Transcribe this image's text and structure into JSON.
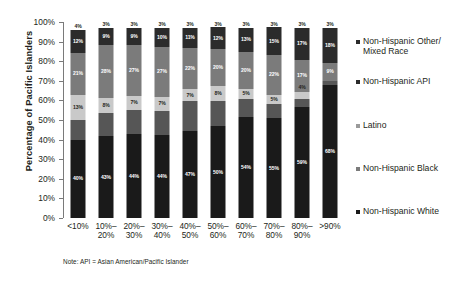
{
  "chart_data": {
    "type": "bar",
    "stacked": true,
    "stack_mode": "percent",
    "title": "",
    "xlabel": "",
    "ylabel": "Percentage of Pacific Islanders",
    "ylim": [
      0,
      100
    ],
    "ytick_labels": [
      "0%",
      "10%",
      "20%",
      "30%",
      "40%",
      "50%",
      "60%",
      "70%",
      "80%",
      "90%",
      "100%"
    ],
    "ytick_values": [
      0,
      10,
      20,
      30,
      40,
      50,
      60,
      70,
      80,
      90,
      100
    ],
    "grid": false,
    "legend_position": "right",
    "categories": [
      "<10%",
      "10%-\n20%",
      "20%-\n30%",
      "30%-\n40%",
      "40%-\n50%",
      "50%-\n60%",
      "60%-\n70%",
      "70%-\n80%",
      "80%-\n90%",
      ">90%"
    ],
    "category_labels": [
      {
        "line1": "<10%",
        "line2": ""
      },
      {
        "line1": "10%–",
        "line2": "20%"
      },
      {
        "line1": "20%–",
        "line2": "30%"
      },
      {
        "line1": "30%–",
        "line2": "40%"
      },
      {
        "line1": "40%–",
        "line2": "50%"
      },
      {
        "line1": "50%–",
        "line2": "60%"
      },
      {
        "line1": "60%–",
        "line2": "70%"
      },
      {
        "line1": "70%–",
        "line2": "80%"
      },
      {
        "line1": "80%–",
        "line2": "90%"
      },
      {
        "line1": ">90%",
        "line2": ""
      }
    ],
    "series": [
      {
        "name": "Non-Hispanic White",
        "color": "#1a1a1a",
        "values": [
          40,
          43,
          44,
          44,
          47,
          50,
          54,
          55,
          59,
          68
        ],
        "labels": [
          "40%",
          "43%",
          "44%",
          "44%",
          "47%",
          "50%",
          "54%",
          "55%",
          "59%",
          "68%"
        ]
      },
      {
        "name": "Non-Hispanic Black",
        "color": "#565656",
        "values": [
          10,
          12,
          13,
          13,
          16,
          14,
          10,
          8,
          4,
          2
        ],
        "labels": [
          "",
          "",
          "",
          "",
          "",
          "",
          "",
          "",
          "",
          ""
        ]
      },
      {
        "name": "Latino",
        "color": "#c9c9c9",
        "values": [
          13,
          8,
          7,
          7,
          7,
          8,
          5,
          5,
          4,
          0
        ],
        "labels": [
          "13%",
          "8%",
          "7%",
          "7%",
          "7%",
          "8%",
          "5%",
          "5%",
          "4%",
          ""
        ]
      },
      {
        "name": "Non-Hispanic API",
        "color": "#7b7b7b",
        "values": [
          21,
          28,
          27,
          27,
          22,
          20,
          20,
          22,
          17,
          9
        ],
        "labels": [
          "21%",
          "28%",
          "27%",
          "27%",
          "22%",
          "20%",
          "20%",
          "22%",
          "17%",
          "9%"
        ]
      },
      {
        "name": "Non-Hispanic Other/Mixed Race",
        "color": "#2b2b2b",
        "values": [
          12,
          9,
          9,
          10,
          11,
          12,
          13,
          15,
          17,
          18
        ],
        "labels": [
          "12%",
          "9%",
          "9%",
          "10%",
          "11%",
          "12%",
          "13%",
          "15%",
          "17%",
          "18%"
        ]
      },
      {
        "name": "Top remainder",
        "color": "#ffffff",
        "values": [
          4,
          3,
          3,
          3,
          3,
          3,
          3,
          3,
          3,
          3
        ],
        "labels": [
          "4%",
          "3%",
          "3%",
          "3%",
          "3%",
          "3%",
          "3%",
          "3%",
          "3%",
          "3%"
        ]
      }
    ],
    "legend": [
      {
        "label_line1": "Non-Hispanic Other/",
        "label_line2": "Mixed Race",
        "color": "#2b2b2b",
        "top": 0
      },
      {
        "label_line1": "Non-Hispanic API",
        "label_line2": "",
        "color": "#2b2b2b",
        "top": 40
      },
      {
        "label_line1": "Latino",
        "label_line2": "",
        "color": "#9a9a9a",
        "top": 84
      },
      {
        "label_line1": "Non-Hispanic Black",
        "label_line2": "",
        "color": "#7b7b7b",
        "top": 127
      },
      {
        "label_line1": "Non-Hispanic White",
        "label_line2": "",
        "color": "#1a1a1a",
        "top": 170
      }
    ],
    "note": "Note: API = Asian American/Pacific Islander"
  }
}
